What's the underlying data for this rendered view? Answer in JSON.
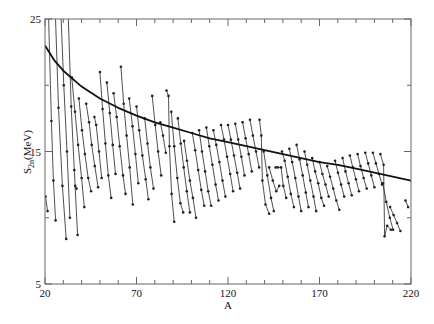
{
  "chart_data": {
    "type": "line",
    "title": "",
    "xlabel": "A",
    "ylabel": "S2n(MeV)",
    "ylabel_main": "S",
    "ylabel_sub": "2n",
    "ylabel_unit": "(MeV)",
    "xlim": [
      20,
      220
    ],
    "ylim": [
      5,
      25
    ],
    "x_ticks": [
      20,
      70,
      120,
      170,
      220
    ],
    "y_ticks": [
      5,
      15,
      25
    ],
    "x_minor_step": 10,
    "y_minor_step": 5,
    "grid": false,
    "legend": null,
    "fit_curve": {
      "name": "smooth trend",
      "x": [
        20,
        25,
        30,
        40,
        50,
        60,
        70,
        80,
        90,
        100,
        110,
        120,
        130,
        140,
        150,
        160,
        170,
        180,
        190,
        200,
        210,
        220
      ],
      "y": [
        23.0,
        21.9,
        21.1,
        19.9,
        19.0,
        18.3,
        17.7,
        17.2,
        16.8,
        16.4,
        16.0,
        15.7,
        15.4,
        15.1,
        14.8,
        14.5,
        14.2,
        14.0,
        13.7,
        13.4,
        13.1,
        12.8
      ]
    },
    "series": [
      {
        "name": "chain-1",
        "x": [
          20.3,
          21.4
        ],
        "y": [
          11.6,
          10.5
        ]
      },
      {
        "name": "chain-2",
        "x": [
          21.8,
          23.5,
          24.6,
          25.8
        ],
        "y": [
          26.0,
          17.3,
          12.8,
          9.8
        ]
      },
      {
        "name": "chain-3",
        "x": [
          25.5,
          27.4,
          29.5,
          31.6
        ],
        "y": [
          26.0,
          18.3,
          12.4,
          8.4
        ]
      },
      {
        "name": "chain-4",
        "x": [
          28.5,
          30.3,
          32.0,
          33.6
        ],
        "y": [
          26.0,
          20.0,
          15.0,
          10.0
        ]
      },
      {
        "name": "chain-5",
        "x": [
          32.5,
          34.3,
          36.0,
          37.8
        ],
        "y": [
          26.0,
          18.4,
          13.6,
          8.7
        ]
      },
      {
        "name": "chain-6",
        "x": [
          36.5,
          37.2
        ],
        "y": [
          12.4,
          12.2
        ]
      },
      {
        "name": "chain-7",
        "x": [
          34.6,
          36.4,
          38.1,
          40.0,
          41.5
        ],
        "y": [
          20.6,
          18.0,
          15.5,
          13.0,
          10.8
        ]
      },
      {
        "name": "chain-8",
        "x": [
          38.5,
          40.2,
          41.8,
          43.6,
          45.2
        ],
        "y": [
          19.0,
          16.6,
          14.8,
          13.0,
          12.0
        ]
      },
      {
        "name": "chain-9",
        "x": [
          42.5,
          44.1,
          45.5,
          47.2,
          49.0
        ],
        "y": [
          18.6,
          17.2,
          15.5,
          13.9,
          12.3
        ]
      },
      {
        "name": "chain-10",
        "x": [
          47.0,
          48.0,
          49.5,
          51.0
        ],
        "y": [
          17.6,
          17.0,
          15.0,
          13.0
        ]
      },
      {
        "name": "chain-11",
        "x": [
          50.0,
          51.5,
          53.0,
          54.6,
          56.2
        ],
        "y": [
          21.0,
          18.2,
          15.6,
          13.2,
          11.5
        ]
      },
      {
        "name": "chain-12",
        "x": [
          53.8,
          55.4,
          57.0,
          58.5
        ],
        "y": [
          20.2,
          17.9,
          15.5,
          13.3
        ]
      },
      {
        "name": "chain-13",
        "x": [
          57.5,
          59.2,
          60.8,
          62.6,
          64.0
        ],
        "y": [
          19.4,
          17.6,
          15.4,
          13.2,
          11.8
        ]
      },
      {
        "name": "chain-14",
        "x": [
          61.5,
          63.0,
          64.6,
          66.3,
          68.0
        ],
        "y": [
          21.4,
          18.6,
          16.2,
          13.8,
          11.0
        ]
      },
      {
        "name": "chain-15",
        "x": [
          66.0,
          67.8,
          69.4,
          71.0
        ],
        "y": [
          19.0,
          16.9,
          14.8,
          12.6
        ]
      },
      {
        "name": "chain-16",
        "x": [
          70.0,
          71.5,
          73.2,
          75.0,
          76.5
        ],
        "y": [
          18.4,
          16.6,
          14.7,
          12.9,
          11.4
        ]
      },
      {
        "name": "chain-17",
        "x": [
          74.5,
          76.0,
          77.6,
          79.3
        ],
        "y": [
          17.5,
          15.6,
          13.8,
          12.2
        ]
      },
      {
        "name": "chain-18",
        "x": [
          78.6,
          80.2,
          81.8,
          83.5
        ],
        "y": [
          19.2,
          17.0,
          15.0,
          13.2
        ]
      },
      {
        "name": "chain-19",
        "x": [
          83.0,
          84.5,
          86.0
        ],
        "y": [
          17.2,
          16.2,
          14.9
        ]
      },
      {
        "name": "chain-20",
        "x": [
          86.4,
          87.5,
          88.0,
          89.2,
          90.6
        ],
        "y": [
          19.6,
          19.2,
          15.4,
          11.8,
          9.7
        ]
      },
      {
        "name": "chain-21",
        "x": [
          89.0,
          90.6,
          92.3,
          94.0,
          95.5
        ],
        "y": [
          18.0,
          15.4,
          13.0,
          11.1,
          10.4
        ]
      },
      {
        "name": "chain-22",
        "x": [
          92.6,
          94.2,
          95.8,
          97.5,
          99.2
        ],
        "y": [
          17.5,
          15.6,
          13.8,
          12.0,
          10.4
        ]
      },
      {
        "name": "chain-23",
        "x": [
          96.0,
          97.6,
          99.2,
          100.8,
          102.5
        ],
        "y": [
          15.8,
          14.3,
          12.8,
          11.5,
          10.0
        ]
      },
      {
        "name": "chain-24",
        "x": [
          100.5,
          102.1,
          103.7,
          105.4,
          107.0
        ],
        "y": [
          16.4,
          15.1,
          13.6,
          12.1,
          10.9
        ]
      },
      {
        "name": "chain-25",
        "x": [
          104.2,
          105.8,
          107.5,
          109.2,
          110.8
        ],
        "y": [
          16.6,
          15.0,
          13.5,
          12.0,
          10.9
        ]
      },
      {
        "name": "chain-26",
        "x": [
          108.2,
          109.8,
          111.5,
          113.2,
          114.8
        ],
        "y": [
          16.8,
          15.4,
          14.0,
          12.5,
          11.3
        ]
      },
      {
        "name": "chain-27",
        "x": [
          112.0,
          113.6,
          115.3,
          117.0,
          118.6
        ],
        "y": [
          16.6,
          15.5,
          14.2,
          12.8,
          11.6
        ]
      },
      {
        "name": "chain-28",
        "x": [
          116.2,
          117.8,
          119.5,
          121.2,
          122.8
        ],
        "y": [
          17.0,
          15.9,
          14.6,
          13.3,
          12.0
        ]
      },
      {
        "name": "chain-29",
        "x": [
          120.0,
          121.6,
          123.3,
          125.0,
          126.6
        ],
        "y": [
          17.0,
          15.9,
          14.7,
          13.4,
          12.2
        ]
      },
      {
        "name": "chain-30",
        "x": [
          124.0,
          125.6,
          127.3,
          129.0
        ],
        "y": [
          17.1,
          15.9,
          14.6,
          13.2
        ]
      },
      {
        "name": "chain-31",
        "x": [
          128.0,
          129.6,
          131.3,
          133.0
        ],
        "y": [
          17.2,
          16.0,
          14.8,
          13.5
        ]
      },
      {
        "name": "chain-32",
        "x": [
          132.0,
          133.6,
          135.3,
          137.0
        ],
        "y": [
          17.4,
          16.2,
          15.0,
          13.8
        ]
      },
      {
        "name": "chain-33",
        "x": [
          137.2,
          138.2,
          138.8,
          140.5,
          142.5
        ],
        "y": [
          17.4,
          16.2,
          12.8,
          11.0,
          10.3
        ]
      },
      {
        "name": "chain-34",
        "x": [
          139.5,
          141.5,
          143.5,
          145.0
        ],
        "y": [
          15.0,
          13.2,
          11.5,
          10.5
        ]
      },
      {
        "name": "chain-35",
        "x": [
          142.5,
          144.5,
          146.4,
          148.0
        ],
        "y": [
          13.8,
          12.8,
          12.0,
          12.4
        ]
      },
      {
        "name": "chain-36",
        "x": [
          146.0,
          147.2,
          149.0,
          150.2,
          151.8
        ],
        "y": [
          13.8,
          13.8,
          13.8,
          12.4,
          11.5
        ]
      },
      {
        "name": "chain-37",
        "x": [
          149.5,
          151.0,
          152.6,
          154.3,
          156.0
        ],
        "y": [
          15.0,
          14.3,
          13.1,
          11.8,
          10.8
        ]
      },
      {
        "name": "chain-38",
        "x": [
          153.5,
          155.1,
          156.8,
          158.5,
          160.0
        ],
        "y": [
          15.2,
          14.2,
          13.0,
          11.6,
          10.5
        ]
      },
      {
        "name": "chain-39",
        "x": [
          157.5,
          159.1,
          160.8,
          162.5,
          164.0
        ],
        "y": [
          15.5,
          14.4,
          13.2,
          11.9,
          10.8
        ]
      },
      {
        "name": "chain-40",
        "x": [
          161.8,
          163.3,
          165.0,
          166.7,
          168.2
        ],
        "y": [
          15.0,
          14.0,
          12.8,
          11.6,
          10.5
        ]
      },
      {
        "name": "chain-41",
        "x": [
          166.0,
          167.6,
          169.3,
          171.0,
          172.5
        ],
        "y": [
          14.5,
          13.5,
          12.6,
          11.5,
          10.9
        ]
      },
      {
        "name": "chain-42",
        "x": [
          170.0,
          171.6,
          173.3,
          175.0
        ],
        "y": [
          14.2,
          13.3,
          12.5,
          11.6
        ]
      },
      {
        "name": "chain-43",
        "x": [
          174.2,
          175.8,
          177.5,
          179.2,
          180.8
        ],
        "y": [
          13.9,
          13.1,
          12.2,
          11.3,
          10.6
        ]
      },
      {
        "name": "chain-44",
        "x": [
          178.5,
          180.1,
          181.8,
          183.5
        ],
        "y": [
          14.3,
          13.4,
          12.5,
          11.6
        ]
      },
      {
        "name": "chain-45",
        "x": [
          182.6,
          184.2,
          185.9,
          187.6
        ],
        "y": [
          14.5,
          13.5,
          12.6,
          11.7
        ]
      },
      {
        "name": "chain-46",
        "x": [
          186.6,
          188.2,
          189.9,
          191.6
        ],
        "y": [
          14.7,
          13.8,
          12.9,
          12.0
        ]
      },
      {
        "name": "chain-47",
        "x": [
          190.8,
          192.4,
          194.1,
          195.8
        ],
        "y": [
          14.8,
          13.9,
          13.0,
          12.2
        ]
      },
      {
        "name": "chain-48",
        "x": [
          195.0,
          196.6,
          198.3,
          200.0
        ],
        "y": [
          14.9,
          14.1,
          13.2,
          12.3
        ]
      },
      {
        "name": "chain-49",
        "x": [
          199.2,
          200.8,
          202.5,
          204.2
        ],
        "y": [
          14.9,
          14.1,
          13.3,
          12.5
        ]
      },
      {
        "name": "chain-50",
        "x": [
          203.3,
          205.0,
          205.6,
          207.0,
          209.0
        ],
        "y": [
          14.8,
          14.0,
          8.6,
          9.4,
          9.1
        ]
      },
      {
        "name": "chain-51",
        "x": [
          204.6,
          206.5,
          208.4,
          210.2
        ],
        "y": [
          12.6,
          11.2,
          10.0,
          9.1
        ]
      },
      {
        "name": "chain-52",
        "x": [
          208.6,
          210.5,
          212.4,
          214.2
        ],
        "y": [
          10.8,
          10.2,
          9.6,
          9.0
        ]
      },
      {
        "name": "chain-53",
        "x": [
          217.0,
          218.4
        ],
        "y": [
          11.3,
          10.8
        ]
      }
    ]
  },
  "axes": {
    "x_tick_labels": [
      "20",
      "70",
      "120",
      "170",
      "220"
    ],
    "y_tick_labels": [
      "5",
      "15",
      "25"
    ],
    "xlabel": "A",
    "ylabel_main": "S",
    "ylabel_sub": "2n",
    "ylabel_unit": "(MeV)"
  },
  "colors": {
    "line": "#222222",
    "axis": "#555555",
    "background": "#ffffff"
  }
}
